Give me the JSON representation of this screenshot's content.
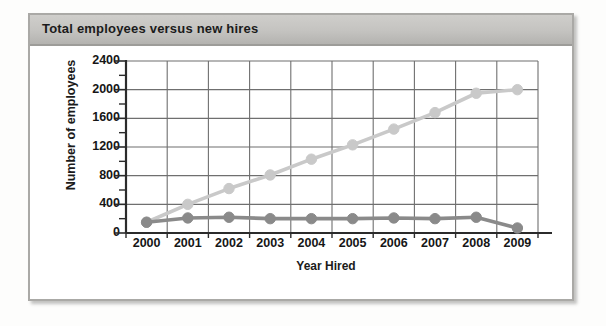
{
  "panel": {
    "title": "Total employees versus new hires"
  },
  "chart_data": {
    "type": "line",
    "title": "Total employees versus new hires",
    "xlabel": "Year Hired",
    "ylabel": "Number of employees",
    "categories": [
      "2000",
      "2001",
      "2002",
      "2003",
      "2004",
      "2005",
      "2006",
      "2007",
      "2008",
      "2009"
    ],
    "ylim": [
      0,
      2400
    ],
    "yticks": [
      0,
      400,
      800,
      1200,
      1600,
      2000,
      2400
    ],
    "ytick_labels": [
      "0",
      "400",
      "800",
      "1200",
      "1600",
      "2000",
      "2400"
    ],
    "minor_ticks": true,
    "grid": true,
    "legend": "none",
    "series": [
      {
        "name": "Total employees",
        "color": "#c9c9c9",
        "marker": "circle",
        "values": [
          150,
          400,
          620,
          810,
          1030,
          1230,
          1450,
          1680,
          1950,
          2000
        ]
      },
      {
        "name": "New hires",
        "color": "#8a8a8a",
        "marker": "circle",
        "values": [
          150,
          210,
          220,
          200,
          200,
          200,
          210,
          200,
          220,
          70
        ]
      }
    ]
  },
  "colors": {
    "panel_border": "#aaa9a6",
    "header_bg": "#c4c3c0",
    "grid": "#6f6f6f",
    "axis": "#2b2b2b",
    "series_light": "#c9c9c9",
    "series_dark": "#8a8a8a"
  }
}
